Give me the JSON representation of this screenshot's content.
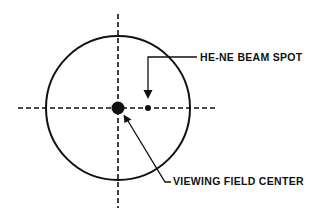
{
  "diagram": {
    "type": "optical-alignment-schematic",
    "labels": {
      "beam_spot": "HE-NE BEAM SPOT",
      "field_center": "VIEWING FIELD CENTER"
    },
    "colors": {
      "ink": "#111111",
      "background": "#ffffff"
    },
    "geometry": {
      "circle": {
        "cx": 118,
        "cy": 108,
        "r": 72
      },
      "crosshair_horizontal": {
        "x1": 18,
        "x2": 218,
        "y": 108
      },
      "crosshair_vertical": {
        "x": 118,
        "y1": 14,
        "y2": 208
      },
      "center_dot": {
        "cx": 118,
        "cy": 108,
        "r": 6.5
      },
      "beam_dot": {
        "cx": 148,
        "cy": 108,
        "r": 3
      }
    }
  }
}
